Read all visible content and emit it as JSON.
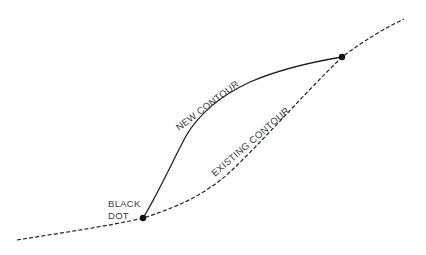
{
  "diagram": {
    "background": "#ffffff",
    "line_color": "#222222",
    "labels": {
      "new_contour": "NEW CONTOUR",
      "existing_contour": "EXISTING CONTOUR",
      "black_dot_line1": "BLACK",
      "black_dot_line2": "DOT"
    },
    "curves": [
      {
        "name": "new-contour",
        "style": "solid",
        "from": [
          143,
          218
        ],
        "to": [
          342,
          57
        ]
      },
      {
        "name": "existing-contour",
        "style": "dashed",
        "from": [
          17,
          240
        ],
        "to": [
          404,
          19
        ]
      }
    ],
    "points": [
      {
        "name": "black-dot-lower",
        "x": 143,
        "y": 218
      },
      {
        "name": "black-dot-upper",
        "x": 342,
        "y": 57
      }
    ]
  }
}
